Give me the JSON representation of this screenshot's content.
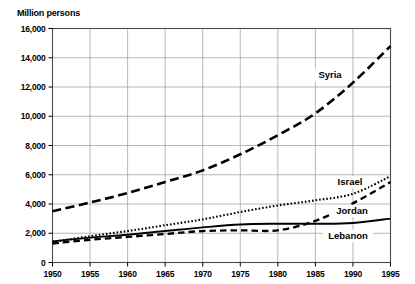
{
  "axis_unit_label": "Million persons",
  "labels": {
    "syria": "Syria",
    "israel": "Israel",
    "jordan": "Jordan",
    "lebanon": "Lebanon"
  },
  "colors": {
    "line": "#000000",
    "grid": "#9a9a9a",
    "frame": "#4a4a4a",
    "background": "#ffffff"
  },
  "chart_data": {
    "type": "line",
    "title": "",
    "subtitle": "",
    "xlabel": "",
    "ylabel": "Million persons",
    "xlim": [
      1950,
      1995
    ],
    "ylim": [
      0,
      16000
    ],
    "grid": true,
    "legend": "inline-labels",
    "xticks": [
      1950,
      1955,
      1960,
      1965,
      1970,
      1975,
      1980,
      1985,
      1990,
      1995
    ],
    "xtick_labels": [
      "1950",
      "1955",
      "1960",
      "1965",
      "1970",
      "1975",
      "1980",
      "1985",
      "1990",
      "1995"
    ],
    "yticks": [
      0,
      2000,
      4000,
      6000,
      8000,
      10000,
      12000,
      14000,
      16000
    ],
    "ytick_labels": [
      "0",
      "2,000",
      "4,000",
      "6,000",
      "8,000",
      "10,000",
      "12,000",
      "14,000",
      "16,000"
    ],
    "x": [
      1950,
      1955,
      1960,
      1965,
      1970,
      1975,
      1980,
      1985,
      1990,
      1995
    ],
    "series": [
      {
        "name": "Syria",
        "style": "long-dash",
        "values": [
          3500,
          4100,
          4750,
          5500,
          6300,
          7400,
          8700,
          10200,
          12300,
          14800
        ]
      },
      {
        "name": "Israel",
        "style": "dotted",
        "values": [
          1400,
          1800,
          2150,
          2550,
          2950,
          3450,
          3900,
          4250,
          4700,
          5900
        ]
      },
      {
        "name": "Jordan",
        "style": "dashed",
        "values": [
          1300,
          1550,
          1750,
          1950,
          2150,
          2200,
          2200,
          2850,
          4050,
          5500
        ]
      },
      {
        "name": "Lebanon",
        "style": "solid",
        "values": [
          1450,
          1700,
          1900,
          2150,
          2400,
          2600,
          2650,
          2650,
          2700,
          3000
        ]
      }
    ]
  }
}
